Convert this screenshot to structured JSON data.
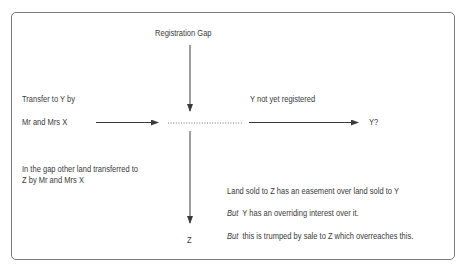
{
  "diagram": {
    "top_label": "Registration Gap",
    "left_label_line1": "Transfer to Y by",
    "left_label_line2": "Mr and Mrs X",
    "right_label": "Y not yet registered",
    "right_target": "Y?",
    "gap_text_line1": "In the gap other land transferred to",
    "gap_text_line2": "Z by Mr and Mrs X",
    "bottom_target": "Z",
    "notes": [
      {
        "prefix": "",
        "text": "Land sold to Z has an easement over land sold to Y"
      },
      {
        "prefix": "But",
        "text": "Y has an overriding interest over it."
      },
      {
        "prefix": "But",
        "text": "this is trumped by sale to Z which overreaches this."
      }
    ]
  },
  "colors": {
    "border": "#7a7a7a",
    "text": "#3a3a3a",
    "arrow": "#3a3a3a"
  }
}
